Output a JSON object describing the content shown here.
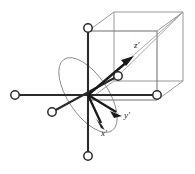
{
  "figure": {
    "background_color": "#ffffff",
    "width": 195,
    "height": 174,
    "colors": {
      "axis": "#2b2b2b",
      "arrow": "#1a1a1a",
      "cube": "#8d8d8d",
      "ellipse": "#8a8a8a",
      "node_fill": "#ffffff",
      "label": "#1a1a1a"
    },
    "labels": [
      {
        "id": "z-prime",
        "text": "z'",
        "x": 134,
        "y": 48
      },
      {
        "id": "y-prime",
        "text": "y'",
        "x": 124,
        "y": 118
      },
      {
        "id": "x-prime",
        "text": "x'",
        "x": 101,
        "y": 136
      }
    ],
    "origin": {
      "x": 88,
      "y": 95
    },
    "nodes": [
      {
        "id": "node-top",
        "x": 88,
        "y": 28,
        "r": 4.2
      },
      {
        "id": "node-bottom",
        "x": 88,
        "y": 156,
        "r": 4.2
      },
      {
        "id": "node-left",
        "x": 15,
        "y": 95,
        "r": 4.2
      },
      {
        "id": "node-right",
        "x": 157,
        "y": 95,
        "r": 4.2
      },
      {
        "id": "node-front-lower",
        "x": 52,
        "y": 112,
        "r": 4.2
      },
      {
        "id": "node-back-upper",
        "x": 118,
        "y": 76,
        "r": 4.2
      }
    ],
    "axes": [
      {
        "id": "axis-vertical",
        "x1": 88,
        "y1": 28,
        "x2": 88,
        "y2": 156
      },
      {
        "id": "axis-horizontal",
        "x1": 15,
        "y1": 95,
        "x2": 157,
        "y2": 95
      },
      {
        "id": "axis-diagonal",
        "x1": 52,
        "y1": 112,
        "x2": 118,
        "y2": 76
      }
    ],
    "prime_axes": [
      {
        "id": "arrow-z-prime",
        "x1": 88,
        "y1": 95,
        "x2": 133,
        "y2": 57
      },
      {
        "id": "arrow-y-prime",
        "x1": 88,
        "y1": 95,
        "x2": 120,
        "y2": 115
      },
      {
        "id": "arrow-x-prime",
        "x1": 88,
        "y1": 95,
        "x2": 105,
        "y2": 128
      }
    ],
    "ellipse": {
      "id": "tilt-ellipse",
      "cx": 88,
      "cy": 95,
      "rx": 20,
      "ry": 43,
      "rotation": -34
    },
    "cube": {
      "id": "wireframe-cube",
      "front": {
        "x": 56,
        "y": 31,
        "w": 101,
        "h": 101
      },
      "depth_dx": 26,
      "depth_dy": -19
    },
    "diagonal_guide": {
      "x1": 88,
      "y1": 95,
      "x2": 183,
      "y2": 12
    }
  }
}
